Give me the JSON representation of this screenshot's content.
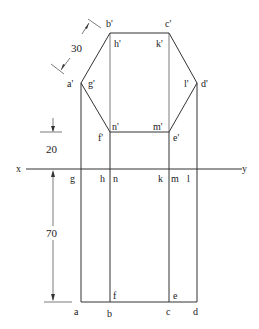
{
  "diagram": {
    "type": "orthographic-projection",
    "reference_line": {
      "left_label": "x",
      "right_label": "y"
    },
    "front_view_labels": {
      "b_prime": "b'",
      "c_prime": "c'",
      "h_prime": "h'",
      "k_prime": "k'",
      "a_prime": "a'",
      "g_prime": "g'",
      "l_prime": "l'",
      "d_prime": "d'",
      "n_prime": "n'",
      "m_prime": "m'",
      "f_prime": "f'",
      "e_prime": "e'"
    },
    "top_view_labels": {
      "g": "g",
      "h": "h",
      "n": "n",
      "k": "k",
      "m": "m",
      "l": "l",
      "a": "a",
      "b": "b",
      "c": "c",
      "d": "d",
      "f": "f",
      "e": "e"
    },
    "dimensions": {
      "side_length": "30",
      "height_above_xy": "20",
      "depth_below_xy": "70"
    },
    "colors": {
      "line": "#333333",
      "background": "#ffffff"
    }
  }
}
